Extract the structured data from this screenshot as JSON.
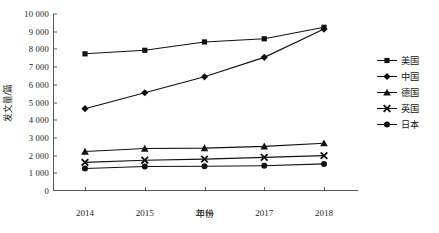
{
  "chart_data": {
    "type": "line",
    "title": "",
    "xlabel": "年份",
    "ylabel": "发文量/篇",
    "x": [
      "2014",
      "2015",
      "2016",
      "2017",
      "2018"
    ],
    "categories": [
      "2014",
      "2015",
      "2016",
      "2017",
      "2018"
    ],
    "ylim": [
      0,
      10000
    ],
    "ytick_values": [
      0,
      1000,
      2000,
      3000,
      4000,
      5000,
      6000,
      7000,
      8000,
      9000,
      10000
    ],
    "ytick_labels": [
      "0",
      "1 000",
      "2 000",
      "3 000",
      "4 000",
      "5 000",
      "6 000",
      "7 000",
      "8 000",
      "9 000",
      "10 000"
    ],
    "grid": false,
    "legend_position": "right",
    "series": [
      {
        "name": "美国",
        "marker": "square",
        "color": "#111111",
        "values": [
          7750,
          7950,
          8420,
          8600,
          9250
        ]
      },
      {
        "name": "中国",
        "marker": "diamond",
        "color": "#111111",
        "values": [
          4650,
          5550,
          6450,
          7550,
          9150
        ]
      },
      {
        "name": "德国",
        "marker": "triangle",
        "color": "#111111",
        "values": [
          2230,
          2400,
          2420,
          2520,
          2700
        ]
      },
      {
        "name": "英国",
        "marker": "cross",
        "color": "#111111",
        "values": [
          1620,
          1740,
          1800,
          1900,
          2000
        ]
      },
      {
        "name": "日本",
        "marker": "circle",
        "color": "#111111",
        "values": [
          1270,
          1380,
          1400,
          1430,
          1530
        ]
      }
    ]
  },
  "legend": {
    "items": [
      {
        "label": "美国",
        "marker": "square"
      },
      {
        "label": "中国",
        "marker": "diamond"
      },
      {
        "label": "德国",
        "marker": "triangle"
      },
      {
        "label": "英国",
        "marker": "cross"
      },
      {
        "label": "日本",
        "marker": "circle"
      }
    ]
  },
  "axes": {
    "x_title": "年份",
    "y_title": "发文量/篇"
  }
}
